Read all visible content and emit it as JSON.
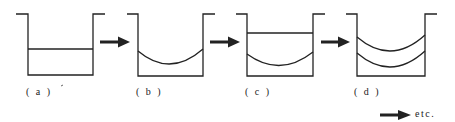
{
  "diagram": {
    "panels": [
      {
        "id": "a",
        "label": "( a )",
        "description": "vessel with flat liquid layer"
      },
      {
        "id": "b",
        "label": "( b )",
        "description": "vessel with curved meniscus layer"
      },
      {
        "id": "c",
        "label": "( c )",
        "description": "curved layer with flat layer above"
      },
      {
        "id": "d",
        "label": "( d )",
        "description": "two stacked curved layers"
      }
    ],
    "continuation": {
      "label": "etc."
    },
    "colors": {
      "stroke": "#222222",
      "background": "#ffffff"
    }
  }
}
